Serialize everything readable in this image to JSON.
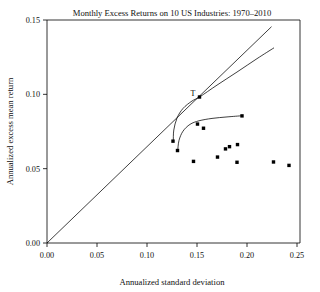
{
  "chart_data": {
    "type": "scatter",
    "title": "Monthly Excess Returns on 10 US Industries: 1970–2010",
    "xlabel": "Annualized standard deviation",
    "ylabel": "Annualized excess mean return",
    "xlim": [
      0.0,
      0.25
    ],
    "ylim": [
      0.0,
      0.155
    ],
    "xticks": [
      0.0,
      0.05,
      0.1,
      0.15,
      0.2,
      0.25
    ],
    "xticklabels": [
      "0.00",
      "0.05",
      "0.10",
      "0.15",
      "0.20",
      "0.25"
    ],
    "yticks": [
      0.0,
      0.05,
      0.1,
      0.15
    ],
    "yticklabels": [
      "0.00",
      "0.05",
      "0.10",
      "0.15"
    ],
    "grid": false,
    "legend": "none",
    "point_color": "#000000",
    "line_color": "#000000",
    "background_color": "#ffffff",
    "series": [
      {
        "name": "industry-portfolios",
        "type": "scatter",
        "marker": "square",
        "points": [
          {
            "x": 0.126,
            "y": 0.0685
          },
          {
            "x": 0.1305,
            "y": 0.0622
          },
          {
            "x": 0.1465,
            "y": 0.0549
          },
          {
            "x": 0.1505,
            "y": 0.08
          },
          {
            "x": 0.1565,
            "y": 0.0772
          },
          {
            "x": 0.1705,
            "y": 0.0578
          },
          {
            "x": 0.1785,
            "y": 0.0633
          },
          {
            "x": 0.1825,
            "y": 0.0648
          },
          {
            "x": 0.1905,
            "y": 0.0662
          },
          {
            "x": 0.19,
            "y": 0.0543
          },
          {
            "x": 0.195,
            "y": 0.0855
          },
          {
            "x": 0.2265,
            "y": 0.0545
          },
          {
            "x": 0.242,
            "y": 0.0522
          }
        ]
      },
      {
        "name": "capital-market-line",
        "type": "line",
        "points": [
          {
            "x": 0.0,
            "y": 0.0
          },
          {
            "x": 0.2245,
            "y": 0.1455
          }
        ]
      },
      {
        "name": "efficient-frontier-upper",
        "type": "line",
        "points": [
          {
            "x": 0.1263,
            "y": 0.0686
          },
          {
            "x": 0.1268,
            "y": 0.076
          },
          {
            "x": 0.13,
            "y": 0.084
          },
          {
            "x": 0.136,
            "y": 0.0905
          },
          {
            "x": 0.145,
            "y": 0.0955
          },
          {
            "x": 0.1525,
            "y": 0.0982
          },
          {
            "x": 0.17,
            "y": 0.1062
          },
          {
            "x": 0.19,
            "y": 0.115
          },
          {
            "x": 0.21,
            "y": 0.124
          },
          {
            "x": 0.227,
            "y": 0.1313
          }
        ]
      },
      {
        "name": "minimum-variance-frontier",
        "type": "line",
        "points": [
          {
            "x": 0.1307,
            "y": 0.062
          },
          {
            "x": 0.132,
            "y": 0.069
          },
          {
            "x": 0.136,
            "y": 0.0752
          },
          {
            "x": 0.143,
            "y": 0.0798
          },
          {
            "x": 0.152,
            "y": 0.0822
          },
          {
            "x": 0.165,
            "y": 0.0838
          },
          {
            "x": 0.18,
            "y": 0.0848
          },
          {
            "x": 0.195,
            "y": 0.0856
          }
        ]
      }
    ],
    "annotations": [
      {
        "label": "T",
        "x": 0.1525,
        "y": 0.0982,
        "marker": true
      }
    ]
  }
}
